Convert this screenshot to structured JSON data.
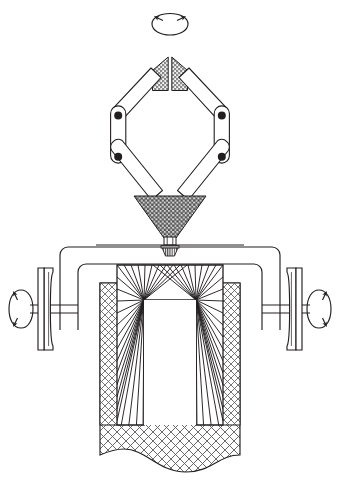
{
  "diagram": {
    "background_color": "#ffffff",
    "line_color": "#231f20",
    "hatch_color": "#6d6d6d",
    "canvas": {
      "width": 340,
      "height": 481
    },
    "annotations": {
      "top_rotation_arrow": "rotation-arrow-top",
      "left_rotation_arrow": "rotation-arrow-left",
      "right_rotation_arrow": "rotation-arrow-right"
    },
    "parts": [
      {
        "id": "rotation-indicator-top",
        "label": "Top rotation indicator",
        "kind": "arrow-ellipse"
      },
      {
        "id": "upper-wedge-left",
        "label": "Upper left wedge",
        "kind": "stippled-wedge"
      },
      {
        "id": "upper-wedge-right",
        "label": "Upper right wedge",
        "kind": "stippled-wedge"
      },
      {
        "id": "link-upper-left",
        "label": "Upper left link arm",
        "kind": "link-bar"
      },
      {
        "id": "link-upper-right",
        "label": "Upper right link arm",
        "kind": "link-bar"
      },
      {
        "id": "link-mid-left",
        "label": "Middle left link arm",
        "kind": "link-bar"
      },
      {
        "id": "link-mid-right",
        "label": "Middle right link arm",
        "kind": "link-bar"
      },
      {
        "id": "link-lower-left",
        "label": "Lower left link arm",
        "kind": "link-bar"
      },
      {
        "id": "link-lower-right",
        "label": "Lower right link arm",
        "kind": "link-bar"
      },
      {
        "id": "pivot-upper-left",
        "label": "Upper left pivot",
        "kind": "pivot"
      },
      {
        "id": "pivot-upper-right",
        "label": "Upper right pivot",
        "kind": "pivot"
      },
      {
        "id": "pivot-lower-left",
        "label": "Lower left pivot",
        "kind": "pivot"
      },
      {
        "id": "pivot-lower-right",
        "label": "Lower right pivot",
        "kind": "pivot"
      },
      {
        "id": "funnel-hopper",
        "label": "Hatched funnel hopper",
        "kind": "hatched-funnel"
      },
      {
        "id": "funnel-neck",
        "label": "Funnel neck",
        "kind": "neck"
      },
      {
        "id": "nozzle",
        "label": "Nozzle",
        "kind": "hatched-nozzle"
      },
      {
        "id": "outer-frame",
        "label": "Outer frame",
        "kind": "rounded-frame"
      },
      {
        "id": "inner-frame",
        "label": "Inner frame",
        "kind": "rounded-frame"
      },
      {
        "id": "radiant-chamber",
        "label": "Radiating line chamber",
        "kind": "radial-fill"
      },
      {
        "id": "chamber-opening",
        "label": "Chamber opening",
        "kind": "opening"
      },
      {
        "id": "mesh-column-left",
        "label": "Left mesh column",
        "kind": "crosshatch"
      },
      {
        "id": "mesh-column-right",
        "label": "Right mesh column",
        "kind": "crosshatch"
      },
      {
        "id": "mesh-sheet",
        "label": "Lower mesh sheet",
        "kind": "crosshatch-wavy"
      },
      {
        "id": "pulley-left",
        "label": "Left grooved pulley",
        "kind": "pulley"
      },
      {
        "id": "pulley-right",
        "label": "Right grooved pulley",
        "kind": "pulley"
      },
      {
        "id": "axle-left",
        "label": "Left axle",
        "kind": "axle"
      },
      {
        "id": "axle-right",
        "label": "Right axle",
        "kind": "axle"
      }
    ]
  }
}
